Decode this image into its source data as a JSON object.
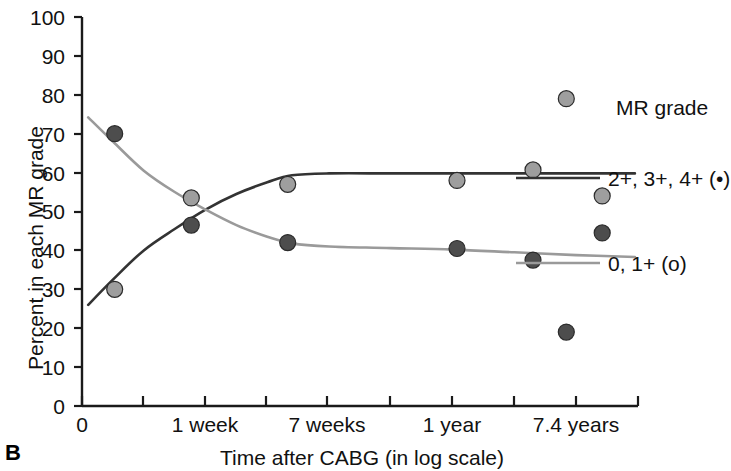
{
  "panel": {
    "letter": "B"
  },
  "chart_data": {
    "type": "scatter",
    "title": "",
    "xlabel": "Time after CABG (in log scale)",
    "ylabel": "Percent in each MR grade",
    "xlim": [
      0,
      9
    ],
    "ylim": [
      0,
      100
    ],
    "grid": false,
    "x_tick_labels": [
      "0",
      "",
      "1 week",
      "",
      "7 weeks",
      "",
      "",
      "1 year",
      "",
      "7.4 years",
      ""
    ],
    "y_tick_labels": [
      "0",
      "10",
      "20",
      "30",
      "40",
      "50",
      "60",
      "70",
      "80",
      "90",
      "100"
    ],
    "y_ticks": [
      0,
      10,
      20,
      30,
      40,
      50,
      60,
      70,
      80,
      90,
      100
    ],
    "legend_title": "MR grade",
    "legend_position": "right",
    "series": [
      {
        "name": "2+, 3+, 4+ (•)",
        "marker": "filled-dark-circle",
        "color": "#4d4d4d",
        "line_color": "#333333",
        "points": [
          {
            "x": 0.53,
            "y": 70.0
          },
          {
            "x": 1.77,
            "y": 46.5
          },
          {
            "x": 3.33,
            "y": 42.0
          },
          {
            "x": 6.07,
            "y": 40.5
          },
          {
            "x": 7.3,
            "y": 37.5
          },
          {
            "x": 7.84,
            "y": 19.0
          },
          {
            "x": 8.42,
            "y": 44.5
          }
        ],
        "curve": [
          {
            "x": 0.1,
            "y": 26.0
          },
          {
            "x": 0.5,
            "y": 32.5
          },
          {
            "x": 1.0,
            "y": 40.0
          },
          {
            "x": 1.5,
            "y": 45.5
          },
          {
            "x": 2.0,
            "y": 50.5
          },
          {
            "x": 2.5,
            "y": 54.5
          },
          {
            "x": 3.0,
            "y": 57.5
          },
          {
            "x": 3.4,
            "y": 59.3
          },
          {
            "x": 4.0,
            "y": 59.8
          },
          {
            "x": 5.0,
            "y": 59.8
          },
          {
            "x": 6.0,
            "y": 59.8
          },
          {
            "x": 7.0,
            "y": 59.8
          },
          {
            "x": 8.0,
            "y": 59.8
          },
          {
            "x": 8.95,
            "y": 59.8
          }
        ]
      },
      {
        "name": "0, 1+ (o)",
        "marker": "filled-light-circle",
        "color": "#9e9e9e",
        "line_color": "#9a9a9a",
        "points": [
          {
            "x": 0.53,
            "y": 30.0
          },
          {
            "x": 1.77,
            "y": 53.5
          },
          {
            "x": 3.33,
            "y": 57.0
          },
          {
            "x": 6.07,
            "y": 58.0
          },
          {
            "x": 7.3,
            "y": 60.7
          },
          {
            "x": 7.84,
            "y": 79.0
          },
          {
            "x": 8.42,
            "y": 54.0
          }
        ],
        "curve": [
          {
            "x": 0.1,
            "y": 74.2
          },
          {
            "x": 0.5,
            "y": 68.0
          },
          {
            "x": 1.0,
            "y": 60.5
          },
          {
            "x": 1.5,
            "y": 55.0
          },
          {
            "x": 2.0,
            "y": 50.5
          },
          {
            "x": 2.5,
            "y": 46.5
          },
          {
            "x": 3.0,
            "y": 43.5
          },
          {
            "x": 3.4,
            "y": 41.8
          },
          {
            "x": 4.0,
            "y": 41.0
          },
          {
            "x": 5.0,
            "y": 40.6
          },
          {
            "x": 6.0,
            "y": 40.2
          },
          {
            "x": 7.0,
            "y": 39.5
          },
          {
            "x": 8.0,
            "y": 38.8
          },
          {
            "x": 8.95,
            "y": 38.3
          }
        ]
      }
    ]
  },
  "axes": {
    "y_title": "Percent in each MR grade",
    "x_title": "Time after CABG (in log scale)",
    "y_labels": [
      "100",
      "90",
      "80",
      "70",
      "60",
      "50",
      "40",
      "30",
      "20",
      "10",
      "0"
    ],
    "x_labels": [
      {
        "text": "0",
        "x": 82
      },
      {
        "text": "1 week",
        "x": 205
      },
      {
        "text": "7 weeks",
        "x": 327
      },
      {
        "text": "1 year",
        "x": 452
      },
      {
        "text": "7.4 years",
        "x": 576
      }
    ]
  },
  "legend": {
    "title": "MR grade",
    "entries": [
      {
        "label": "2+, 3+, 4+ (•)",
        "swatch_color": "#333333"
      },
      {
        "label": "0, 1+ (o)",
        "swatch_color": "#9a9a9a"
      }
    ]
  }
}
